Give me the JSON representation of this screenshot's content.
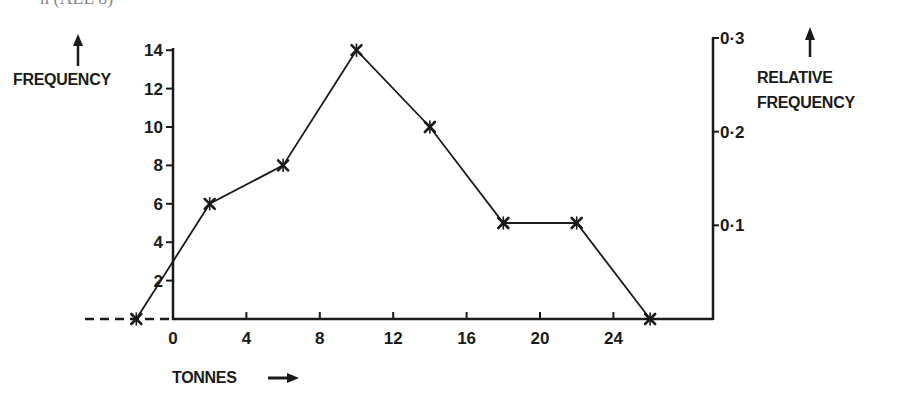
{
  "header_fragment": "n (ALL 8)",
  "chart_data": {
    "type": "line",
    "title": "",
    "xlabel": "TONNES",
    "ylabel": "FREQUENCY",
    "y2label": "RELATIVE FREQUENCY",
    "x": [
      -2,
      2,
      6,
      10,
      14,
      18,
      22,
      26
    ],
    "series": [
      {
        "name": "Frequency polygon",
        "values": [
          0,
          6,
          8,
          14,
          10,
          5,
          5,
          0
        ],
        "marker": "x"
      }
    ],
    "x_ticks": [
      0,
      4,
      8,
      12,
      16,
      20,
      24
    ],
    "x_tick_labels": [
      "0",
      "4",
      "8",
      "12",
      "16",
      "20",
      "24"
    ],
    "y_ticks": [
      2,
      4,
      6,
      8,
      10,
      12,
      14
    ],
    "y_tick_labels": [
      "2",
      "4",
      "6",
      "8",
      "10",
      "12",
      "14"
    ],
    "y2_ticks": [
      0.1,
      0.2,
      0.3
    ],
    "y2_tick_labels": [
      "0·1",
      "0·2",
      "0·3"
    ],
    "xlim": [
      -2,
      26
    ],
    "ylim": [
      0,
      14
    ],
    "y2lim": [
      0,
      0.3
    ],
    "grid": false,
    "legend": null,
    "annotations": [
      "dashed extension of x-axis to the left of 0"
    ]
  },
  "labels": {
    "frequency": "FREQUENCY",
    "relative_line1": "RELATIVE",
    "relative_line2": "FREQUENCY",
    "tonnes": "TONNES"
  }
}
